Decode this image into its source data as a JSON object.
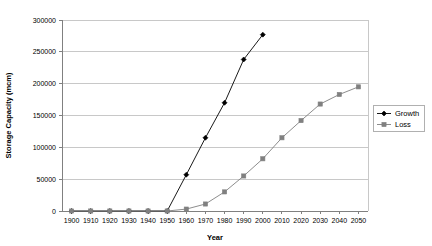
{
  "chart_data": {
    "type": "line",
    "title": "",
    "xlabel": "Year",
    "ylabel": "Storage Capacity (mcm)",
    "x": [
      1900,
      1910,
      1920,
      1930,
      1940,
      1950,
      1960,
      1970,
      1980,
      1990,
      2000,
      2010,
      2020,
      2030,
      2040,
      2050
    ],
    "xlim": [
      1895,
      2055
    ],
    "ylim": [
      0,
      300000
    ],
    "xticks": [
      "1900",
      "1910",
      "1920",
      "1930",
      "1940",
      "1950",
      "1960",
      "1970",
      "1980",
      "1990",
      "2000",
      "2010",
      "2020",
      "2030",
      "2040",
      "2050"
    ],
    "yticks": [
      "0",
      "50000",
      "100000",
      "150000",
      "200000",
      "250000",
      "300000"
    ],
    "ytick_values": [
      0,
      50000,
      100000,
      150000,
      200000,
      250000,
      300000
    ],
    "grid": "horizontal",
    "legend_position": "right",
    "series": [
      {
        "name": "Growth",
        "color": "#000000",
        "marker": "diamond",
        "values": [
          0,
          0,
          0,
          0,
          0,
          0,
          57000,
          115000,
          170000,
          238000,
          277000,
          null,
          null,
          null,
          null,
          null
        ],
        "x": [
          1900,
          1910,
          1920,
          1930,
          1940,
          1950,
          1960,
          1970,
          1980,
          1990,
          2000,
          2010,
          2020,
          2030,
          2040,
          2050
        ]
      },
      {
        "name": "Loss",
        "color": "#808080",
        "marker": "square",
        "values": [
          0,
          0,
          0,
          0,
          0,
          0,
          3000,
          11000,
          30000,
          55000,
          82000,
          115000,
          142000,
          168000,
          183000,
          195000
        ],
        "x": [
          1900,
          1910,
          1920,
          1930,
          1940,
          1950,
          1960,
          1970,
          1980,
          1990,
          2000,
          2010,
          2020,
          2030,
          2040,
          2050
        ]
      }
    ]
  },
  "legend": {
    "items": [
      {
        "label": "Growth"
      },
      {
        "label": "Loss"
      }
    ]
  },
  "colors": {
    "growth": "#000000",
    "loss": "#808080",
    "grid": "#c8c8c8",
    "axis": "#808080",
    "background": "#ffffff"
  }
}
